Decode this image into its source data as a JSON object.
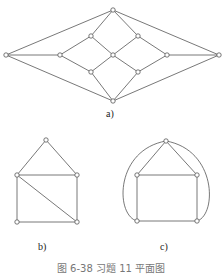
{
  "figure": {
    "caption": "图 6-38   习题 11 平面图",
    "labels": {
      "a": "a)",
      "b": "b)",
      "c": "c)"
    }
  },
  "graphs": {
    "a": {
      "nodes": [
        [
          113,
          10
        ],
        [
          6,
          55
        ],
        [
          219,
          55
        ],
        [
          113,
          101
        ],
        [
          60,
          55
        ],
        [
          167,
          55
        ],
        [
          113,
          55
        ],
        [
          91,
          36
        ],
        [
          138,
          36
        ],
        [
          91,
          72
        ],
        [
          138,
          72
        ]
      ],
      "edges": [
        [
          0,
          1
        ],
        [
          0,
          2
        ],
        [
          1,
          3
        ],
        [
          2,
          3
        ],
        [
          1,
          4
        ],
        [
          5,
          2
        ],
        [
          0,
          7
        ],
        [
          0,
          8
        ],
        [
          3,
          9
        ],
        [
          3,
          10
        ],
        [
          4,
          7
        ],
        [
          4,
          9
        ],
        [
          5,
          8
        ],
        [
          5,
          10
        ],
        [
          7,
          6
        ],
        [
          8,
          6
        ],
        [
          9,
          6
        ],
        [
          10,
          6
        ]
      ]
    },
    "b": {
      "nodes": [
        [
          46,
          140
        ],
        [
          17,
          175
        ],
        [
          77,
          175
        ],
        [
          17,
          222
        ],
        [
          77,
          222
        ]
      ],
      "edges": [
        [
          0,
          1
        ],
        [
          0,
          2
        ],
        [
          1,
          2
        ],
        [
          1,
          3
        ],
        [
          2,
          4
        ],
        [
          3,
          4
        ],
        [
          1,
          4
        ]
      ]
    },
    "c": {
      "nodes": [
        [
          166,
          141
        ],
        [
          137,
          175
        ],
        [
          197,
          175
        ],
        [
          137,
          221
        ],
        [
          197,
          221
        ]
      ],
      "edges": [
        [
          0,
          1
        ],
        [
          0,
          2
        ],
        [
          1,
          2
        ],
        [
          1,
          3
        ],
        [
          2,
          4
        ],
        [
          3,
          4
        ]
      ],
      "arcs": [
        "M166,141 C115,150 115,215 137,221",
        "M166,141 C217,150 217,215 197,221"
      ]
    }
  }
}
